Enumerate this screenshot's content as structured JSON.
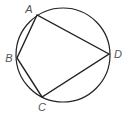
{
  "diagram": {
    "type": "cyclic-quadrilateral",
    "circle": {
      "cx": 63,
      "cy": 55,
      "r": 47
    },
    "stroke_color": "#222222",
    "label_color": "#555555",
    "vertices": [
      {
        "name": "A",
        "x": 37,
        "y": 15,
        "label": "A",
        "label_x": 29,
        "label_y": 13
      },
      {
        "name": "B",
        "x": 17,
        "y": 58,
        "label": "B",
        "label_x": 9,
        "label_y": 62
      },
      {
        "name": "C",
        "x": 42,
        "y": 97,
        "label": "C",
        "label_x": 42,
        "label_y": 111
      },
      {
        "name": "D",
        "x": 109,
        "y": 54,
        "label": "D",
        "label_x": 118,
        "label_y": 58
      }
    ],
    "edges": [
      [
        "A",
        "B"
      ],
      [
        "B",
        "C"
      ],
      [
        "C",
        "D"
      ],
      [
        "D",
        "A"
      ]
    ]
  }
}
